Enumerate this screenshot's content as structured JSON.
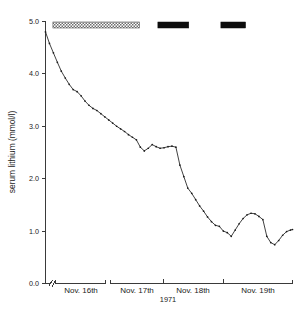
{
  "chart_data": {
    "type": "line",
    "title": "",
    "subtitle": "",
    "xlabel": "1971",
    "ylabel": "serum lithium (mmol/l)",
    "ylim": [
      0.0,
      5.0
    ],
    "ytick_labels": [
      "0.0",
      "1.0",
      "2.0",
      "3.0",
      "4.0",
      "5.0"
    ],
    "ytick_values": [
      0.0,
      1.0,
      2.0,
      3.0,
      4.0,
      5.0
    ],
    "xtick_labels": [
      "Nov. 16th",
      "Nov. 17th",
      "Nov. 18th",
      "Nov. 19th"
    ],
    "grid": false,
    "legend": "none",
    "axis_break": true,
    "series": [
      {
        "name": "serum lithium",
        "marker": "dot",
        "x": [
          0.0,
          1.6,
          3.2,
          4.8,
          6.4,
          8.0,
          9.6,
          11.2,
          12.8,
          14.4,
          16.0,
          17.6,
          19.2,
          20.8,
          22.4,
          24.0,
          25.6,
          27.2,
          28.8,
          30.4,
          32.0,
          33.6,
          35.2,
          36.8,
          38.4,
          40.0,
          41.6,
          43.2,
          44.8,
          46.4,
          48.0,
          49.6,
          51.2,
          52.8,
          54.4,
          56.0,
          57.6,
          59.2,
          60.8,
          62.4,
          64.0,
          65.6,
          67.2,
          68.8,
          70.4,
          72.0,
          73.6,
          75.2,
          76.8,
          78.4,
          80.0,
          81.6,
          83.2,
          84.8,
          86.4,
          88.0,
          89.6,
          91.2,
          92.8,
          94.4,
          96.0,
          97.6,
          99.2,
          100.0
        ],
        "y": [
          4.8,
          4.58,
          4.4,
          4.22,
          4.05,
          3.92,
          3.8,
          3.7,
          3.66,
          3.58,
          3.48,
          3.4,
          3.34,
          3.3,
          3.24,
          3.18,
          3.12,
          3.06,
          3.0,
          2.95,
          2.9,
          2.84,
          2.79,
          2.74,
          2.6,
          2.53,
          2.58,
          2.65,
          2.61,
          2.58,
          2.59,
          2.61,
          2.62,
          2.6,
          2.26,
          2.04,
          1.82,
          1.72,
          1.6,
          1.48,
          1.38,
          1.27,
          1.18,
          1.11,
          1.09,
          1.0,
          0.97,
          0.9,
          1.02,
          1.14,
          1.24,
          1.31,
          1.34,
          1.33,
          1.28,
          1.22,
          0.9,
          0.78,
          0.74,
          0.82,
          0.92,
          0.99,
          1.02,
          1.03
        ]
      }
    ],
    "annotation_bars": [
      {
        "name": "treatment-bar-hatched",
        "style": "hatched",
        "x_start": 3.0,
        "x_end": 38.0,
        "color": "#7a7a7a"
      },
      {
        "name": "treatment-bar-solid-1",
        "style": "solid",
        "x_start": 45.5,
        "x_end": 58.0,
        "color": "#0d0d0d"
      },
      {
        "name": "treatment-bar-solid-2",
        "style": "solid",
        "x_start": 71.0,
        "x_end": 81.0,
        "color": "#0d0d0d"
      }
    ]
  },
  "axes": {
    "y_axis_title": "serum lithium (mmol/l)",
    "x_axis_title": "1971",
    "y_ticks": [
      "0.0",
      "1.0",
      "2.0",
      "3.0",
      "4.0",
      "5.0"
    ],
    "x_day_labels": [
      "Nov. 16th",
      "Nov. 17th",
      "Nov. 18th",
      "Nov. 19th"
    ]
  }
}
